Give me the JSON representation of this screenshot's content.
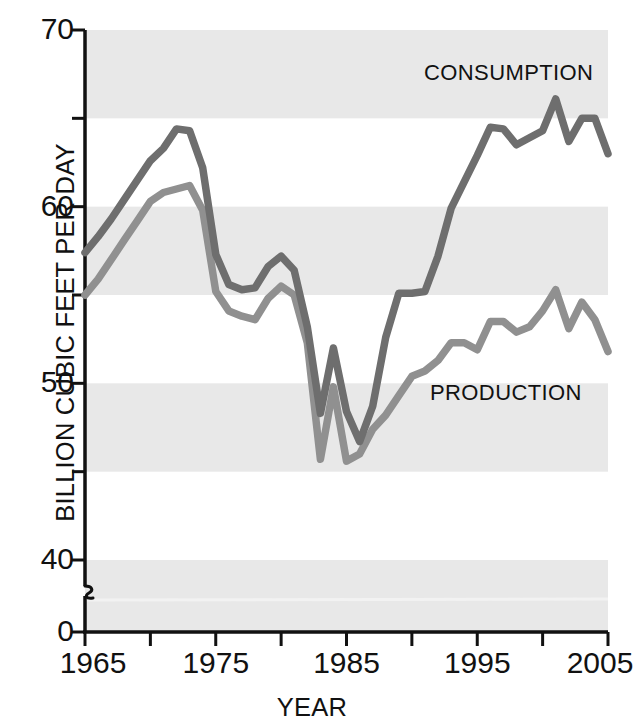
{
  "chart_data": {
    "type": "line",
    "title": "",
    "xlabel": "YEAR",
    "ylabel": "BILLION CUBIC FEET PER DAY",
    "xlim": [
      1965,
      2005
    ],
    "ylim": [
      40,
      70
    ],
    "y_axis_break": true,
    "y_break_note": "axis broken between 0 and 40",
    "grid": "alternating horizontal shaded bands every 5 units",
    "legend_position": "inline annotations on plot",
    "x_tick_values": [
      1965,
      1970,
      1975,
      1980,
      1985,
      1990,
      1995,
      2000,
      2005
    ],
    "x_tick_labels": [
      "1965",
      "",
      "1975",
      "",
      "1985",
      "",
      "1995",
      "",
      "2005"
    ],
    "y_tick_values": [
      0,
      40,
      45,
      50,
      55,
      60,
      65,
      70
    ],
    "y_tick_labels": [
      "0",
      "40",
      "",
      "50",
      "",
      "60",
      "",
      "70"
    ],
    "x": [
      1965,
      1966,
      1967,
      1968,
      1969,
      1970,
      1971,
      1972,
      1973,
      1974,
      1975,
      1976,
      1977,
      1978,
      1979,
      1980,
      1981,
      1982,
      1983,
      1984,
      1985,
      1986,
      1987,
      1988,
      1989,
      1990,
      1991,
      1992,
      1993,
      1994,
      1995,
      1996,
      1997,
      1998,
      1999,
      2000,
      2001,
      2002,
      2003,
      2004,
      2005
    ],
    "series": [
      {
        "name": "CONSUMPTION",
        "color": "#6e6e6e",
        "values": [
          57.4,
          58.3,
          59.3,
          60.4,
          61.5,
          62.6,
          63.3,
          64.4,
          64.3,
          62.2,
          57.3,
          55.6,
          55.3,
          55.4,
          56.6,
          57.2,
          56.4,
          53.2,
          48.3,
          52.0,
          48.4,
          46.7,
          48.7,
          52.6,
          55.1,
          55.1,
          55.2,
          57.2,
          59.9,
          61.4,
          62.9,
          64.5,
          64.4,
          63.5,
          63.9,
          64.3,
          66.1,
          63.7,
          65.0,
          65.0,
          63.0
        ]
      },
      {
        "name": "PRODUCTION",
        "color": "#909090",
        "values": [
          55.0,
          55.9,
          57.0,
          58.1,
          59.2,
          60.3,
          60.8,
          61.0,
          61.2,
          59.8,
          55.2,
          54.1,
          53.8,
          53.6,
          54.8,
          55.5,
          55.0,
          52.3,
          45.7,
          49.8,
          45.6,
          46.0,
          47.4,
          48.2,
          49.3,
          50.4,
          50.7,
          51.3,
          52.3,
          52.3,
          51.9,
          53.5,
          53.5,
          52.9,
          53.2,
          54.1,
          55.3,
          53.1,
          54.6,
          53.6,
          51.8
        ]
      }
    ],
    "annotations": [
      {
        "text": "CONSUMPTION",
        "series": "CONSUMPTION"
      },
      {
        "text": "PRODUCTION",
        "series": "PRODUCTION"
      }
    ]
  },
  "axes": {
    "y_title": "BILLION CUBIC FEET PER DAY",
    "x_title": "YEAR",
    "y_labels": [
      {
        "value": 70,
        "text": "70"
      },
      {
        "value": 60,
        "text": "60"
      },
      {
        "value": 50,
        "text": "50"
      },
      {
        "value": 40,
        "text": "40"
      },
      {
        "value": 0,
        "text": "0"
      }
    ],
    "x_labels": [
      {
        "value": 1965,
        "text": "1965"
      },
      {
        "value": 1975,
        "text": "1975"
      },
      {
        "value": 1985,
        "text": "1985"
      },
      {
        "value": 1995,
        "text": "1995"
      },
      {
        "value": 2005,
        "text": "2005"
      }
    ]
  },
  "style": {
    "band_color": "#e8e8e8",
    "background": "#ffffff",
    "axis_color": "#111111",
    "consumption_color": "#6e6e6e",
    "production_color": "#909090"
  }
}
